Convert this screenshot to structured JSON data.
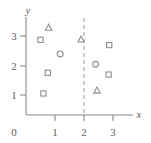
{
  "chart_data": {
    "type": "scatter",
    "title": "",
    "xlabel": "x",
    "ylabel": "y",
    "xlim": [
      0,
      3.6
    ],
    "ylim": [
      0,
      3.4
    ],
    "xticks": [
      0,
      1,
      2,
      3
    ],
    "xtick_labels": [
      "0",
      "1",
      "2",
      "3"
    ],
    "yticks": [
      1,
      2,
      3
    ],
    "ytick_labels": [
      "1",
      "2",
      "3"
    ],
    "grid": false,
    "legend": "none",
    "annotations": [
      {
        "name": "vertical-split-line",
        "type": "vline",
        "x": 2,
        "style": "dashed",
        "color": "#9a9a9a"
      }
    ],
    "series": [
      {
        "name": "squares",
        "marker": "square",
        "color": "#8d8d8d",
        "points": [
          {
            "x": 0.5,
            "y": 2.55
          },
          {
            "x": 0.75,
            "y": 1.43
          },
          {
            "x": 0.6,
            "y": 0.73
          },
          {
            "x": 2.87,
            "y": 2.37
          },
          {
            "x": 2.85,
            "y": 1.37
          }
        ]
      },
      {
        "name": "circles",
        "marker": "circle",
        "color": "#8d8d8d",
        "points": [
          {
            "x": 1.18,
            "y": 2.07
          },
          {
            "x": 2.4,
            "y": 1.72
          }
        ]
      },
      {
        "name": "triangles",
        "marker": "triangle",
        "color": "#8d8d8d",
        "points": [
          {
            "x": 0.78,
            "y": 2.95
          },
          {
            "x": 1.9,
            "y": 2.55
          },
          {
            "x": 2.45,
            "y": 0.82
          }
        ]
      }
    ]
  },
  "axes": {
    "x_axis_label": "x",
    "y_axis_label": "y",
    "origin_label": "0",
    "x_tick_1": "1",
    "x_tick_2": "2",
    "x_tick_3": "3",
    "y_tick_1": "1",
    "y_tick_2": "2",
    "y_tick_3": "3"
  }
}
